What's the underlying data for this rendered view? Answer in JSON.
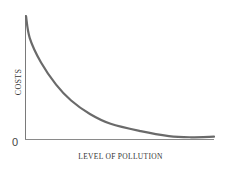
{
  "chart_data": {
    "type": "line",
    "title": "",
    "xlabel": "LEVEL OF POLLUTION",
    "ylabel": "COSTS",
    "origin_label": "0",
    "x": [
      0,
      0.02,
      0.08,
      0.16,
      0.24,
      0.34,
      0.45,
      0.61,
      0.76,
      0.87,
      1.0
    ],
    "series": [
      {
        "name": "Costs",
        "values": [
          1.0,
          0.82,
          0.62,
          0.44,
          0.31,
          0.2,
          0.12,
          0.06,
          0.02,
          0.01,
          0.015
        ]
      }
    ],
    "xlim": [
      0,
      1
    ],
    "ylim": [
      0,
      1
    ],
    "grid": false,
    "legend": "none",
    "colors": {
      "curve": "#6a6a6a",
      "axis": "#777777"
    }
  },
  "labels": {
    "ylabel": "COSTS",
    "xlabel": "LEVEL OF POLLUTION",
    "origin": "0"
  }
}
